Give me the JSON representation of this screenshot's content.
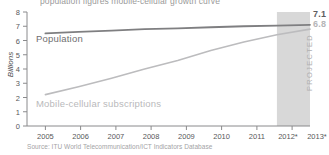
{
  "chart_data": {
    "type": "line",
    "title": "population figures mobile-cellular growth curve",
    "xlabel": "",
    "ylabel": "Billions",
    "x": [
      "2005",
      "2006",
      "2007",
      "2008",
      "2009",
      "2010",
      "2011",
      "2012*",
      "2013*"
    ],
    "ylim": [
      0,
      8
    ],
    "y_ticks": [
      "0",
      "1",
      "2",
      "3",
      "4",
      "5",
      "6",
      "7",
      "8"
    ],
    "grid": false,
    "legend": "inline-annotations",
    "series": [
      {
        "name": "Population",
        "color": "#7f7f81",
        "values": [
          6.5,
          6.6,
          6.7,
          6.8,
          6.85,
          6.93,
          7.0,
          7.05,
          7.1
        ],
        "end_label": "7.1"
      },
      {
        "name": "Mobile-cellular subscriptions",
        "color": "#bcbcbe",
        "values": [
          2.2,
          2.75,
          3.35,
          4.0,
          4.6,
          5.3,
          5.9,
          6.4,
          6.8
        ],
        "end_label": "6.8"
      }
    ],
    "annotations": {
      "projected_band_label": "PROJECTED",
      "projected_band_start": "2012*",
      "projected_band_end": "2013*",
      "projected_band_color": "#d8d8d8"
    },
    "source": "Source: ITU World Telecommunication/ICT Indicators Database"
  }
}
